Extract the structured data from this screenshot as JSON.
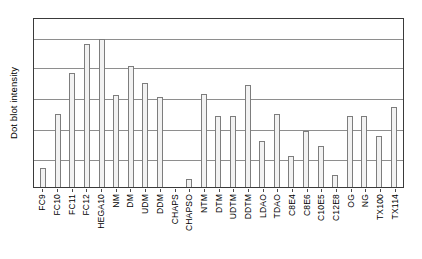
{
  "chart_data": {
    "type": "bar",
    "title": "",
    "subtitle": "",
    "xlabel": "",
    "ylabel": "Dot blot intensity",
    "ylim": [
      0,
      100
    ],
    "grid": true,
    "gridlines_y": [
      17,
      35,
      53,
      71,
      88
    ],
    "legend": null,
    "axis_tick_labels_y": [],
    "categories": [
      "FC9",
      "FC10",
      "FC11",
      "FC12",
      "HEGA10",
      "NM",
      "DM",
      "UDM",
      "DDM",
      "CHAPS",
      "CHAPSO",
      "NTM",
      "DTM",
      "UDTM",
      "DDTM",
      "LDAO",
      "TDAO",
      "C8E4",
      "C8E6",
      "C10E5",
      "C12E8",
      "OG",
      "NG",
      "TX100",
      "TX114"
    ],
    "values": [
      11,
      43,
      67,
      84,
      87,
      54,
      71,
      61,
      53,
      0,
      5,
      55,
      42,
      42,
      60,
      27,
      43,
      18,
      33,
      24,
      7,
      42,
      42,
      30,
      47
    ],
    "bar_facecolor": "#f2f2f2",
    "bar_edgecolor": "#7d7d7d",
    "frame_color": "#3a3a3a",
    "grid_color": "#8e8e8e",
    "background_color": "#ffffff"
  },
  "figure": {
    "ylabel": "Dot blot intensity"
  }
}
